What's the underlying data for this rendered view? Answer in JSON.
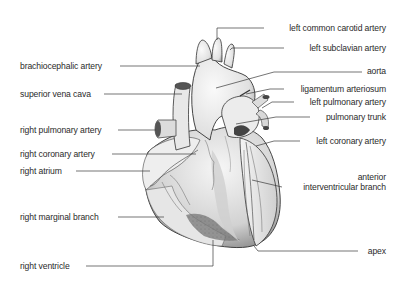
{
  "diagram": {
    "left_labels": [
      {
        "id": "brachiocephalic-artery",
        "text": "brachiocephalic artery",
        "x": 20,
        "y": 61
      },
      {
        "id": "superior-vena-cava",
        "text": "superior vena cava",
        "x": 20,
        "y": 89
      },
      {
        "id": "right-pulmonary-artery",
        "text": "right pulmonary artery",
        "x": 20,
        "y": 125
      },
      {
        "id": "right-coronary-artery",
        "text": "right coronary artery",
        "x": 20,
        "y": 149
      },
      {
        "id": "right-atrium",
        "text": "right atrium",
        "x": 20,
        "y": 166
      },
      {
        "id": "right-marginal-branch",
        "text": "right marginal branch",
        "x": 20,
        "y": 212
      },
      {
        "id": "right-ventricle",
        "text": "right ventricle",
        "x": 20,
        "y": 261
      }
    ],
    "right_labels": [
      {
        "id": "left-common-carotid-artery",
        "text": "left common carotid artery",
        "right": 20,
        "y": 23
      },
      {
        "id": "left-subclavian-artery",
        "text": "left subclavian artery",
        "right": 20,
        "y": 43
      },
      {
        "id": "aorta",
        "text": "aorta",
        "right": 20,
        "y": 66
      },
      {
        "id": "ligamentum-arteriosum",
        "text": "ligamentum arteriosum",
        "right": 20,
        "y": 84
      },
      {
        "id": "left-pulmonary-artery",
        "text": "left pulmonary artery",
        "right": 20,
        "y": 97
      },
      {
        "id": "pulmonary-trunk",
        "text": "pulmonary trunk",
        "right": 20,
        "y": 112
      },
      {
        "id": "left-coronary-artery",
        "text": "left coronary artery",
        "right": 20,
        "y": 136
      },
      {
        "id": "anterior-interventricular-branch-1",
        "text": "anterior",
        "right": 20,
        "y": 172
      },
      {
        "id": "anterior-interventricular-branch-2",
        "text": "interventricular branch",
        "right": 20,
        "y": 182
      },
      {
        "id": "apex",
        "text": "apex",
        "right": 20,
        "y": 246
      }
    ],
    "colors": {
      "ink": "#2a2a2a",
      "line": "#3a3a3a",
      "fill_light": "#f2f2f2",
      "fill_mid": "#d9d9d9",
      "fill_dark": "#8a8a8a"
    }
  }
}
